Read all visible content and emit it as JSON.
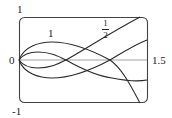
{
  "diagram": {
    "type": "parametric-curve-family",
    "axis_labels": {
      "y_top": "1",
      "y_bottom": "-1",
      "x_left": "0",
      "x_right": "1.5"
    },
    "curve_labels": {
      "outer": "1",
      "inner_num": "1",
      "inner_den": "2"
    },
    "colors": {
      "stroke": "#2a2a2a",
      "axis": "#888888",
      "frame": "#444444"
    }
  }
}
